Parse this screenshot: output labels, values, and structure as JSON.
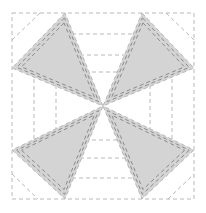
{
  "diagram": {
    "title": "",
    "type": "quilt-block-pattern",
    "colors": {
      "background": "#ffffff",
      "fill": "#d4d4d4",
      "seam": "#8c8c8c",
      "guide": "#b9b9b9"
    },
    "outer_square": {
      "x": 12,
      "y": 13,
      "w": 182,
      "h": 186
    },
    "center": [
      103,
      106
    ],
    "triangles": [
      {
        "name": "top-left",
        "points": [
          [
            65,
            13
          ],
          [
            12,
            68
          ],
          [
            103,
            106
          ]
        ]
      },
      {
        "name": "top-right",
        "points": [
          [
            142,
            13
          ],
          [
            194,
            68
          ],
          [
            103,
            106
          ]
        ]
      },
      {
        "name": "bottom-left",
        "points": [
          [
            12,
            150
          ],
          [
            65,
            199
          ],
          [
            103,
            106
          ]
        ]
      },
      {
        "name": "bottom-right",
        "points": [
          [
            194,
            150
          ],
          [
            142,
            199
          ],
          [
            103,
            106
          ]
        ]
      }
    ],
    "guides": [
      [
        [
          65,
          34
        ],
        [
          142,
          34
        ]
      ],
      [
        [
          73,
          55
        ],
        [
          135,
          55
        ]
      ],
      [
        [
          78,
          72
        ],
        [
          128,
          72
        ]
      ],
      [
        [
          78,
          140
        ],
        [
          128,
          140
        ]
      ],
      [
        [
          73,
          158
        ],
        [
          135,
          158
        ]
      ],
      [
        [
          65,
          178
        ],
        [
          142,
          178
        ]
      ],
      [
        [
          34,
          72
        ],
        [
          34,
          140
        ]
      ],
      [
        [
          56,
          78
        ],
        [
          56,
          134
        ]
      ],
      [
        [
          172,
          72
        ],
        [
          172,
          140
        ]
      ],
      [
        [
          150,
          78
        ],
        [
          150,
          134
        ]
      ],
      [
        [
          12,
          40
        ],
        [
          40,
          13
        ]
      ],
      [
        [
          166,
          13
        ],
        [
          194,
          40
        ]
      ],
      [
        [
          12,
          174
        ],
        [
          38,
          199
        ]
      ],
      [
        [
          168,
          199
        ],
        [
          194,
          174
        ]
      ]
    ]
  }
}
